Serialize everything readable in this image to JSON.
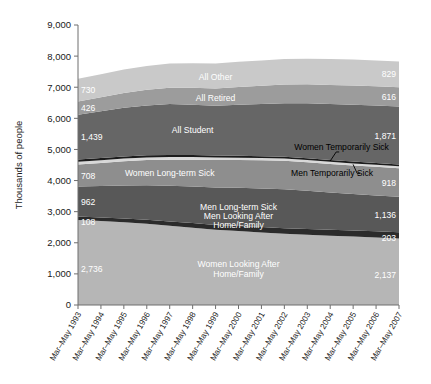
{
  "chart_data": {
    "type": "area",
    "stacked": true,
    "title": "",
    "xlabel": "",
    "ylabel": "Thousands of people",
    "ylim": [
      0,
      9000
    ],
    "ytick_step": 1000,
    "yticks": [
      "0",
      "1,000",
      "2,000",
      "3,000",
      "4,000",
      "5,000",
      "6,000",
      "7,000",
      "8,000",
      "9,000"
    ],
    "grid": false,
    "legend": "in-plot-labels",
    "categories": [
      "Mar–May 1993",
      "Mar–May 1994",
      "Mar–May 1995",
      "Mar–May 1996",
      "Mar–May 1997",
      "Mar–May 1998",
      "Mar–May 1999",
      "Mar–May 2000",
      "Mar–May 2001",
      "Mar–May 2002",
      "Mar–May 2003",
      "Mar–May 2004",
      "Mar–May 2005",
      "Mar–May 2006",
      "Mar–May 2007"
    ],
    "series": [
      {
        "name": "Women Looking After Home/Family",
        "color": "#b6b6b6",
        "label_line1": "Women Looking After",
        "label_line2": "Home/Family",
        "start_value": "2,736",
        "end_value": "2,137",
        "values": [
          2736,
          2700,
          2660,
          2610,
          2545,
          2480,
          2415,
          2375,
          2330,
          2290,
          2255,
          2225,
          2200,
          2170,
          2137
        ]
      },
      {
        "name": "Men Looking After Home/Family",
        "color": "#2b2b2b",
        "label_line1": "Men Looking After",
        "label_line2": "Home/Family",
        "start_value": "108",
        "end_value": "203",
        "values": [
          108,
          116,
          124,
          132,
          142,
          152,
          160,
          168,
          174,
          180,
          186,
          190,
          194,
          198,
          203
        ]
      },
      {
        "name": "Men Long-term Sick",
        "color": "#585858",
        "label_line1": "Men Long-term Sick",
        "label_line2": "",
        "start_value": "962",
        "end_value": "1,136",
        "values": [
          962,
          1010,
          1060,
          1110,
          1150,
          1180,
          1205,
          1225,
          1240,
          1250,
          1230,
          1200,
          1175,
          1155,
          1136
        ]
      },
      {
        "name": "Women Long-term Sick",
        "color": "#8e8e8e",
        "label_line1": "Women Long-term Sick",
        "label_line2": "",
        "start_value": "708",
        "end_value": "918",
        "values": [
          708,
          740,
          775,
          805,
          835,
          860,
          880,
          895,
          905,
          915,
          920,
          920,
          918,
          918,
          918
        ]
      },
      {
        "name": "Men Temporarily Sick",
        "color": "#d8d8d8",
        "label_line1": "Men Temporarily Sick",
        "label_line2": "",
        "start_value": "",
        "end_value": "",
        "values": [
          92,
          90,
          88,
          86,
          84,
          82,
          78,
          74,
          72,
          70,
          68,
          66,
          65,
          64,
          63
        ]
      },
      {
        "name": "Women Temporarily Sick",
        "color": "#1c1c1c",
        "label_line1": "Women Temporarily Sick",
        "label_line2": "",
        "start_value": "",
        "end_value": "",
        "values": [
          70,
          70,
          70,
          68,
          68,
          66,
          64,
          62,
          60,
          60,
          58,
          58,
          57,
          56,
          56
        ]
      },
      {
        "name": "All Student",
        "color": "#666666",
        "label_line1": "All Student",
        "label_line2": "",
        "start_value": "1,439",
        "end_value": "1,871",
        "values": [
          1439,
          1500,
          1565,
          1605,
          1640,
          1620,
          1605,
          1640,
          1680,
          1720,
          1765,
          1800,
          1830,
          1850,
          1871
        ]
      },
      {
        "name": "All Retired",
        "color": "#9c9c9c",
        "label_line1": "All Retired",
        "label_line2": "",
        "start_value": "426",
        "end_value": "616",
        "values": [
          426,
          450,
          475,
          500,
          520,
          540,
          555,
          570,
          585,
          600,
          610,
          615,
          618,
          617,
          616
        ]
      },
      {
        "name": "All Other",
        "color": "#c9c9c9",
        "label_line1": "All Other",
        "label_line2": "",
        "start_value": "730",
        "end_value": "829",
        "values": [
          730,
          740,
          752,
          765,
          778,
          790,
          800,
          808,
          815,
          820,
          826,
          830,
          832,
          830,
          829
        ]
      }
    ],
    "callouts": [
      {
        "name": "women-temporarily-sick-callout",
        "text": "Women Temporarily Sick"
      },
      {
        "name": "men-temporarily-sick-callout",
        "text": "Men Temporarily Sick"
      }
    ]
  }
}
